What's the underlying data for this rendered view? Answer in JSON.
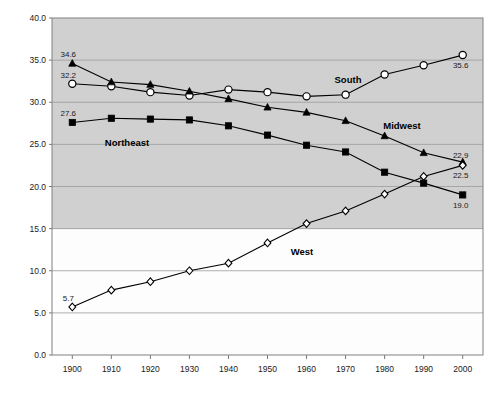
{
  "chart_data": {
    "type": "line",
    "title": "",
    "xlabel": "",
    "ylabel": "",
    "x": [
      1900,
      1910,
      1920,
      1930,
      1940,
      1950,
      1960,
      1970,
      1980,
      1990,
      2000
    ],
    "xtick_labels": [
      "1900",
      "1910",
      "1920",
      "1930",
      "1940",
      "1950",
      "1960",
      "1970",
      "1980",
      "1990",
      "2000"
    ],
    "ytick_labels": [
      "0.0",
      "5.0",
      "10.0",
      "15.0",
      "20.0",
      "25.0",
      "30.0",
      "35.0",
      "40.0"
    ],
    "ylim": [
      0.0,
      40.0
    ],
    "xlim": [
      1895,
      2005
    ],
    "ytick_step": 5.0,
    "grid": "horizontal",
    "legend": "inline-annotations",
    "series": [
      {
        "name": "South",
        "marker": "open-circle",
        "color": "#000000",
        "values": [
          32.2,
          31.9,
          31.2,
          30.8,
          31.5,
          31.2,
          30.7,
          30.9,
          33.3,
          34.4,
          35.6
        ],
        "start_label": "32.2",
        "end_label": "35.6",
        "label_text": "South"
      },
      {
        "name": "Midwest",
        "marker": "filled-triangle",
        "color": "#000000",
        "values": [
          34.6,
          32.4,
          32.1,
          31.3,
          30.4,
          29.4,
          28.8,
          27.8,
          26.0,
          24.0,
          22.9
        ],
        "start_label": "34.6",
        "end_label": "22.9",
        "label_text": "Midwest"
      },
      {
        "name": "Northeast",
        "marker": "filled-square",
        "color": "#000000",
        "values": [
          27.6,
          28.1,
          28.0,
          27.9,
          27.2,
          26.1,
          24.9,
          24.1,
          21.7,
          20.4,
          19.0
        ],
        "start_label": "27.6",
        "end_label": "19.0",
        "label_text": "Northeast"
      },
      {
        "name": "West",
        "marker": "open-diamond",
        "color": "#000000",
        "values": [
          5.7,
          7.7,
          8.7,
          10.0,
          10.9,
          13.3,
          15.6,
          17.1,
          19.1,
          21.2,
          22.5
        ],
        "start_label": "5.7",
        "end_label": "22.5",
        "label_text": "West"
      }
    ]
  },
  "axes": {
    "y_ticks": [
      "40.0",
      "35.0",
      "30.0",
      "25.0",
      "20.0",
      "15.0",
      "10.0",
      "5.0",
      "0.0"
    ],
    "x_ticks": [
      "1900",
      "1910",
      "1920",
      "1930",
      "1940",
      "1950",
      "1960",
      "1970",
      "1980",
      "1990",
      "2000"
    ]
  }
}
